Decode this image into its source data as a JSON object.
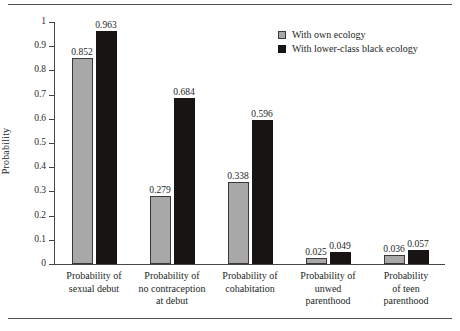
{
  "chart_data": {
    "type": "bar",
    "title": "",
    "xlabel": "",
    "ylabel": "Probability",
    "ylim": [
      0,
      1
    ],
    "ytick_labels": [
      "0",
      "0.1",
      "0.2",
      "0.3",
      "0.4",
      "0.5",
      "0.6",
      "0.7",
      "0.8",
      "0.9",
      "1"
    ],
    "ytick_values": [
      0,
      0.1,
      0.2,
      0.3,
      0.4,
      0.5,
      0.6,
      0.7,
      0.8,
      0.9,
      1
    ],
    "grid": false,
    "legend_position": "top-right",
    "categories": [
      "Probability of sexual debut",
      "Probability of no contraception at debut",
      "Probability of cohabitation",
      "Probability of unwed parenthood",
      "Probability of teen parenthood"
    ],
    "category_lines": [
      [
        "Probability of",
        "sexual debut"
      ],
      [
        "Probability of",
        "no contraception",
        "at debut"
      ],
      [
        "Probability of",
        "cohabitation"
      ],
      [
        "Probability of",
        "unwed",
        "parenthood"
      ],
      [
        "Probability",
        "of teen",
        "parenthood"
      ]
    ],
    "series": [
      {
        "name": "With own ecology",
        "color": "#a8a8a8",
        "values": [
          0.852,
          0.279,
          0.338,
          0.025,
          0.036
        ],
        "labels": [
          "0.852",
          "0.279",
          "0.338",
          "0.025",
          "0.036"
        ]
      },
      {
        "name": "With lower-class black ecology",
        "color": "#171413",
        "values": [
          0.963,
          0.684,
          0.596,
          0.049,
          0.057
        ],
        "labels": [
          "0.963",
          "0.684",
          "0.596",
          "0.049",
          "0.057"
        ]
      }
    ]
  },
  "legend": {
    "items": [
      {
        "label": "With own ecology"
      },
      {
        "label": "With lower-class black ecology"
      }
    ]
  }
}
